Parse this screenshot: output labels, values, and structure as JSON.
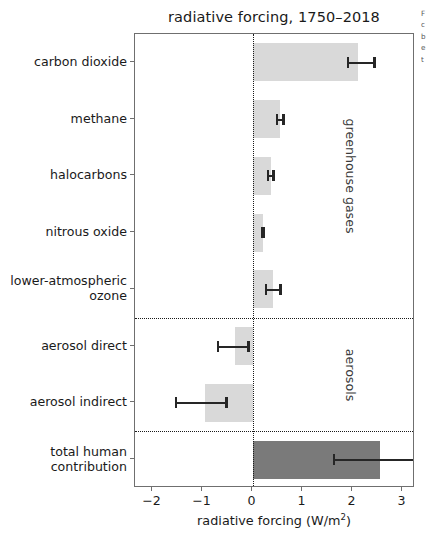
{
  "chart_data": {
    "type": "bar",
    "orientation": "horizontal",
    "title": "radiative forcing, 1750–2018",
    "xlabel": "radiative forcing (W/m²)",
    "xlabel_main": "radiative forcing (W/m",
    "xlabel_sup": "2",
    "xlabel_tail": ")",
    "ylabel": "",
    "xlim": [
      -2.35,
      3.25
    ],
    "ylim": [
      0,
      8
    ],
    "grid": false,
    "legend": null,
    "zero_line": 0,
    "xticks": [
      -2,
      -1,
      0,
      1,
      2,
      3
    ],
    "xticklabels": [
      "−2",
      "−1",
      "0",
      "1",
      "2",
      "3"
    ],
    "categories": [
      "carbon dioxide",
      "methane",
      "halocarbons",
      "nitrous oxide",
      "lower-atmospheric\nozone",
      "aerosol direct",
      "aerosol indirect",
      "total human\ncontribution"
    ],
    "values": [
      2.1,
      0.54,
      0.36,
      0.2,
      0.4,
      -0.35,
      -0.95,
      2.55
    ],
    "err_low": [
      1.88,
      0.47,
      0.28,
      0.16,
      0.24,
      -0.72,
      -1.55,
      1.6
    ],
    "err_high": [
      2.46,
      0.64,
      0.44,
      0.24,
      0.58,
      -0.06,
      -0.5,
      3.25
    ],
    "bar_colors": [
      "#d9d9d9",
      "#d9d9d9",
      "#d9d9d9",
      "#d9d9d9",
      "#d9d9d9",
      "#d9d9d9",
      "#d9d9d9",
      "#7a7a7a"
    ],
    "errorbar_color": "#262626",
    "group_separators": [
      5,
      7
    ],
    "annotations": [
      {
        "text": "greenhouse gases",
        "rotation": 90
      },
      {
        "text": "aerosols",
        "rotation": 90
      }
    ]
  },
  "bars": [
    {
      "label": "carbon dioxide",
      "label_line1": "carbon dioxide",
      "label_line2": "",
      "value": 2.1,
      "err_low": 1.88,
      "err_high": 2.46,
      "color": "#d9d9d9"
    },
    {
      "label": "methane",
      "label_line1": "methane",
      "label_line2": "",
      "value": 0.54,
      "err_low": 0.47,
      "err_high": 0.64,
      "color": "#d9d9d9"
    },
    {
      "label": "halocarbons",
      "label_line1": "halocarbons",
      "label_line2": "",
      "value": 0.36,
      "err_low": 0.28,
      "err_high": 0.44,
      "color": "#d9d9d9"
    },
    {
      "label": "nitrous oxide",
      "label_line1": "nitrous oxide",
      "label_line2": "",
      "value": 0.2,
      "err_low": 0.16,
      "err_high": 0.24,
      "color": "#d9d9d9"
    },
    {
      "label": "lower-atmospheric ozone",
      "label_line1": "lower-atmospheric",
      "label_line2": "ozone",
      "value": 0.4,
      "err_low": 0.24,
      "err_high": 0.58,
      "color": "#d9d9d9"
    },
    {
      "label": "aerosol direct",
      "label_line1": "aerosol direct",
      "label_line2": "",
      "value": -0.35,
      "err_low": -0.72,
      "err_high": -0.06,
      "color": "#d9d9d9"
    },
    {
      "label": "aerosol indirect",
      "label_line1": "aerosol indirect",
      "label_line2": "",
      "value": -0.95,
      "err_low": -1.55,
      "err_high": -0.5,
      "color": "#d9d9d9"
    },
    {
      "label": "total human contribution",
      "label_line1": "total human",
      "label_line2": "contribution",
      "value": 2.55,
      "err_low": 1.6,
      "err_high": 3.25,
      "color": "#7a7a7a"
    }
  ],
  "group_labels": [
    {
      "text": "greenhouse gases"
    },
    {
      "text": "aerosols"
    }
  ],
  "xticklabels": [
    "−2",
    "−1",
    "0",
    "1",
    "2",
    "3"
  ],
  "side_caption": {
    "line1": "F",
    "line2": "c",
    "line3": "b",
    "line4": "e",
    "line5": "t"
  }
}
